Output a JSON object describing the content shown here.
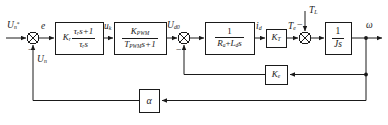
{
  "diagram": {
    "type": "control-block-diagram",
    "width": 388,
    "height": 125,
    "line_color": "#1a1a1a",
    "background": "#ffffff"
  },
  "signals": {
    "reference_input": "U",
    "reference_input_sub": "n",
    "reference_input_sup": "*",
    "error": "e",
    "speed_feedback_voltage": "U",
    "speed_feedback_voltage_sub": "n",
    "regulator_output": "u",
    "regulator_output_sub": "k",
    "converter_output": "U",
    "converter_output_sub": "d0",
    "armature_current": "i",
    "armature_current_sub": "d",
    "electromagnetic_torque": "T",
    "electromagnetic_torque_sub": "e",
    "load_torque": "T",
    "load_torque_sub": "L",
    "output_speed": "ω"
  },
  "blocks": [
    {
      "id": "pi-regulator",
      "name": "speed-regulator-block",
      "gain": "K",
      "gain_sub": "r",
      "numerator": "τ",
      "numerator_sub": "r",
      "numerator_tail": "s+1",
      "denominator": "τ",
      "denominator_sub": "r",
      "denominator_tail": "s"
    },
    {
      "id": "pwm-converter",
      "name": "pwm-converter-block",
      "numerator": "K",
      "numerator_sub": "PWM",
      "denominator": "T",
      "denominator_sub": "PWM",
      "denominator_tail": "s+1"
    },
    {
      "id": "armature-circuit",
      "name": "armature-circuit-block",
      "numerator": "1",
      "denominator_a": "R",
      "denominator_a_sub": "a",
      "denominator_plus": "+",
      "denominator_b": "L",
      "denominator_b_sub": "d",
      "denominator_tail": "s"
    },
    {
      "id": "torque-constant",
      "name": "torque-constant-block",
      "label": "K",
      "label_sub": "T"
    },
    {
      "id": "inertia",
      "name": "inertia-block",
      "numerator": "1",
      "denominator": "Js"
    },
    {
      "id": "emf-constant",
      "name": "back-emf-constant-block",
      "label": "K",
      "label_sub": "e"
    },
    {
      "id": "speed-feedback",
      "name": "speed-feedback-gain-block",
      "label": "α"
    }
  ],
  "summing_junctions": [
    {
      "id": "sum-1",
      "name": "speed-error-summing-junction",
      "negative_sign": "−"
    },
    {
      "id": "sum-2",
      "name": "emf-summing-junction",
      "negative_sign": "−"
    },
    {
      "id": "sum-3",
      "name": "torque-summing-junction",
      "negative_sign": "−"
    }
  ]
}
